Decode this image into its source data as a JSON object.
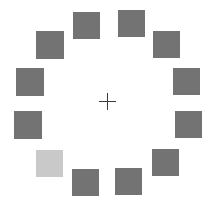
{
  "stimulus": {
    "width": 211,
    "height": 208,
    "background": "#ffffff",
    "fixation": {
      "symbol": "+",
      "color": "#3a3a3a",
      "center": [
        107,
        101
      ]
    },
    "colors": {
      "distractor": "#737373",
      "target": "#c9c9c9"
    },
    "squares": [
      {
        "id": "top-left",
        "x": 73,
        "y": 12,
        "size": 27,
        "role": "distractor"
      },
      {
        "id": "top-right",
        "x": 118,
        "y": 10,
        "size": 27,
        "role": "distractor"
      },
      {
        "id": "upper-right",
        "x": 153,
        "y": 31,
        "size": 27,
        "role": "distractor"
      },
      {
        "id": "right-upper",
        "x": 173,
        "y": 68,
        "size": 27,
        "role": "distractor"
      },
      {
        "id": "right-lower",
        "x": 175,
        "y": 111,
        "size": 27,
        "role": "distractor"
      },
      {
        "id": "lower-right",
        "x": 152,
        "y": 149,
        "size": 27,
        "role": "distractor"
      },
      {
        "id": "bottom-right",
        "x": 115,
        "y": 168,
        "size": 27,
        "role": "distractor"
      },
      {
        "id": "bottom-left",
        "x": 72,
        "y": 169,
        "size": 27,
        "role": "distractor"
      },
      {
        "id": "lower-left",
        "x": 36,
        "y": 150,
        "size": 27,
        "role": "target"
      },
      {
        "id": "left-lower",
        "x": 14,
        "y": 111,
        "size": 28,
        "role": "distractor"
      },
      {
        "id": "left-upper",
        "x": 16,
        "y": 68,
        "size": 28,
        "role": "distractor"
      },
      {
        "id": "upper-left",
        "x": 36,
        "y": 31,
        "size": 28,
        "role": "distractor"
      }
    ]
  }
}
